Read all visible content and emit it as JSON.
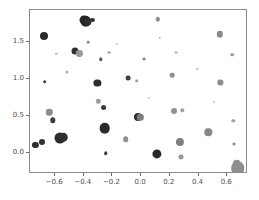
{
  "chart_data": {
    "type": "scatter",
    "title": "",
    "xlabel": "",
    "ylabel": "",
    "xlim": [
      -0.775,
      0.745
    ],
    "ylim": [
      -0.28,
      1.925
    ],
    "grid": false,
    "legend": null,
    "xticks": [
      -0.6,
      -0.4,
      -0.2,
      0.0,
      0.2,
      0.4,
      0.6
    ],
    "xticklabels": [
      "−0.6",
      "−0.4",
      "−0.2",
      "0.0",
      "0.2",
      "0.4",
      "0.6"
    ],
    "yticks": [
      0.0,
      0.5,
      1.0,
      1.5
    ],
    "yticklabels": [
      "0.0",
      "0.5",
      "1.0",
      "1.5"
    ],
    "colormap": "grayscale",
    "marker": "circle",
    "n_points": 51,
    "points": [
      {
        "x": -0.737,
        "y": 0.115,
        "size": 6.2,
        "color": "#2e2e2e"
      },
      {
        "x": -0.69,
        "y": 0.152,
        "size": 6.0,
        "color": "#333333"
      },
      {
        "x": -0.68,
        "y": 1.58,
        "size": 8.0,
        "color": "#2a2a2a"
      },
      {
        "x": -0.672,
        "y": 0.962,
        "size": 3.6,
        "color": "#3a3a3a"
      },
      {
        "x": -0.64,
        "y": 0.548,
        "size": 6.4,
        "color": "#8c8c8c"
      },
      {
        "x": -0.615,
        "y": 0.442,
        "size": 5.4,
        "color": "#3d3d3d"
      },
      {
        "x": -0.568,
        "y": 0.205,
        "size": 11.0,
        "color": "#2b2b2b"
      },
      {
        "x": -0.545,
        "y": 0.212,
        "size": 8.6,
        "color": "#303030"
      },
      {
        "x": -0.52,
        "y": 1.085,
        "size": 3.0,
        "color": "#b0b0b0"
      },
      {
        "x": -0.463,
        "y": 1.368,
        "size": 7.0,
        "color": "#303030"
      },
      {
        "x": -0.43,
        "y": 1.342,
        "size": 6.2,
        "color": "#9a9a9a"
      },
      {
        "x": -0.4,
        "y": 1.79,
        "size": 9.0,
        "color": "#2c2c2c"
      },
      {
        "x": -0.386,
        "y": 1.775,
        "size": 10.5,
        "color": "#262626"
      },
      {
        "x": -0.372,
        "y": 1.762,
        "size": 7.2,
        "color": "#2f2f2f"
      },
      {
        "x": -0.368,
        "y": 1.49,
        "size": 2.6,
        "color": "#8f8f8f"
      },
      {
        "x": -0.34,
        "y": 1.788,
        "size": 4.2,
        "color": "#343434"
      },
      {
        "x": -0.305,
        "y": 0.942,
        "size": 7.2,
        "color": "#2d2d2d"
      },
      {
        "x": -0.3,
        "y": 0.7,
        "size": 4.4,
        "color": "#9d9d9d"
      },
      {
        "x": -0.282,
        "y": 1.262,
        "size": 3.4,
        "color": "#595959"
      },
      {
        "x": -0.262,
        "y": 0.612,
        "size": 5.8,
        "color": "#383838"
      },
      {
        "x": -0.255,
        "y": 0.332,
        "size": 10.6,
        "color": "#2b2b2b"
      },
      {
        "x": -0.248,
        "y": 0.0,
        "size": 3.6,
        "color": "#3c3c3c"
      },
      {
        "x": -0.225,
        "y": 1.352,
        "size": 2.8,
        "color": "#8a8a8a"
      },
      {
        "x": -0.108,
        "y": 0.188,
        "size": 5.6,
        "color": "#8e8e8e"
      },
      {
        "x": -0.092,
        "y": 1.012,
        "size": 4.8,
        "color": "#3f3f3f"
      },
      {
        "x": -0.03,
        "y": 0.972,
        "size": 3.6,
        "color": "#999999"
      },
      {
        "x": -0.022,
        "y": 0.487,
        "size": 8.0,
        "color": "#2e2e2e"
      },
      {
        "x": -0.005,
        "y": 0.484,
        "size": 6.4,
        "color": "#7d7d7d"
      },
      {
        "x": 0.022,
        "y": 1.268,
        "size": 2.8,
        "color": "#8c8c8c"
      },
      {
        "x": 0.112,
        "y": -0.015,
        "size": 9.2,
        "color": "#292929"
      },
      {
        "x": 0.118,
        "y": 1.8,
        "size": 4.4,
        "color": "#8f8f8f"
      },
      {
        "x": 0.128,
        "y": 1.552,
        "size": 2.6,
        "color": "#b4b4b4"
      },
      {
        "x": 0.215,
        "y": 1.048,
        "size": 4.6,
        "color": "#8e8e8e"
      },
      {
        "x": 0.228,
        "y": 0.572,
        "size": 6.0,
        "color": "#909090"
      },
      {
        "x": 0.242,
        "y": 1.352,
        "size": 2.8,
        "color": "#aaaaaa"
      },
      {
        "x": 0.272,
        "y": 0.152,
        "size": 8.2,
        "color": "#808080"
      },
      {
        "x": 0.278,
        "y": -0.055,
        "size": 5.0,
        "color": "#959595"
      },
      {
        "x": 0.288,
        "y": 0.578,
        "size": 3.4,
        "color": "#a2a2a2"
      },
      {
        "x": 0.468,
        "y": 0.282,
        "size": 7.4,
        "color": "#888888"
      },
      {
        "x": 0.548,
        "y": 1.598,
        "size": 6.4,
        "color": "#8b8b8b"
      },
      {
        "x": 0.552,
        "y": 0.952,
        "size": 5.2,
        "color": "#8d8d8d"
      },
      {
        "x": 0.635,
        "y": 1.325,
        "size": 3.6,
        "color": "#9e9e9e"
      },
      {
        "x": 0.642,
        "y": 0.432,
        "size": 3.4,
        "color": "#a0a0a0"
      },
      {
        "x": 0.648,
        "y": 0.128,
        "size": 3.2,
        "color": "#8a8a8a"
      },
      {
        "x": 0.666,
        "y": -0.15,
        "size": 8.4,
        "color": "#909090"
      },
      {
        "x": 0.672,
        "y": -0.205,
        "size": 13.6,
        "color": "#8e8e8e"
      },
      {
        "x": -0.592,
        "y": 1.34,
        "size": 2.4,
        "color": "#c0c0c0"
      },
      {
        "x": -0.168,
        "y": 1.468,
        "size": 2.2,
        "color": "#c4c4c4"
      },
      {
        "x": 0.052,
        "y": 0.748,
        "size": 2.2,
        "color": "#c2c2c2"
      },
      {
        "x": 0.392,
        "y": 1.128,
        "size": 2.2,
        "color": "#c6c6c6"
      },
      {
        "x": 0.505,
        "y": 0.688,
        "size": 2.2,
        "color": "#c3c3c3"
      }
    ],
    "axes_geometry": {
      "left_px": 29,
      "top_px": 9,
      "width_px": 218,
      "height_px": 164
    },
    "style": {
      "background": "#ffffff",
      "frame_color": "#8a8a8a",
      "tick_color": "#6b6b6b",
      "tick_label_color": "#4d4d4d"
    }
  }
}
